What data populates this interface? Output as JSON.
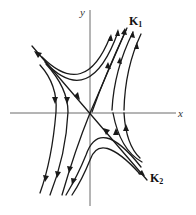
{
  "figure": {
    "type": "phase-portrait",
    "axes": {
      "x_label": "x",
      "y_label": "y"
    },
    "eigenvectors": [
      {
        "label": "K",
        "subscript": "1",
        "direction": "outgoing"
      },
      {
        "label": "K",
        "subscript": "2",
        "direction": "incoming"
      }
    ],
    "colors": {
      "axis": "#6b6b6b",
      "trajectory": "#1a1a1a",
      "background": "#ffffff"
    }
  }
}
